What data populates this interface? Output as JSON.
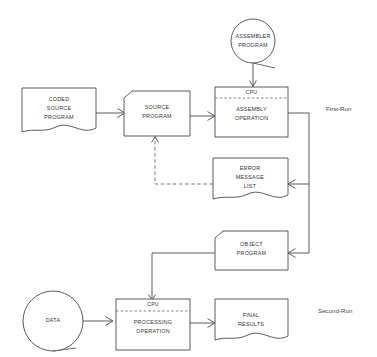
{
  "diagram": {
    "background_color": "#ffffff",
    "line_color": "#4a4a4a",
    "text_color": "#333333"
  },
  "nodes": {
    "assembler_program": {
      "label_line1": "ASSEMBLER",
      "label_line2": "PROGRAM",
      "shape": "circle-tape"
    },
    "coded_source_program": {
      "label_line1": "CODED",
      "label_line2": "SOURCE",
      "label_line3": "PROGRAM",
      "shape": "document"
    },
    "source_program": {
      "label_line1": "SOURCE",
      "label_line2": "PROGRAM",
      "shape": "punched-card"
    },
    "assembly_operation": {
      "cpu": "CPU",
      "label_line1": "ASSEMBLY",
      "label_line2": "OPERATION",
      "shape": "cpu-process"
    },
    "error_message_list": {
      "label_line1": "ERROR",
      "label_line2": "MESSAGE",
      "label_line3": "LIST",
      "shape": "document"
    },
    "object_program": {
      "label_line1": "OBJECT",
      "label_line2": "PROGRAM",
      "shape": "punched-card"
    },
    "data": {
      "label_line1": "DATA",
      "shape": "circle-tape"
    },
    "processing_operation": {
      "cpu": "CPU",
      "label_line1": "PROCESSING",
      "label_line2": "OPERATION",
      "shape": "cpu-process"
    },
    "final_results": {
      "label_line1": "FINAL",
      "label_line2": "RESULTS",
      "shape": "document"
    }
  },
  "annotations": {
    "first_run": "First-Run",
    "second_run": "Second-Run"
  }
}
